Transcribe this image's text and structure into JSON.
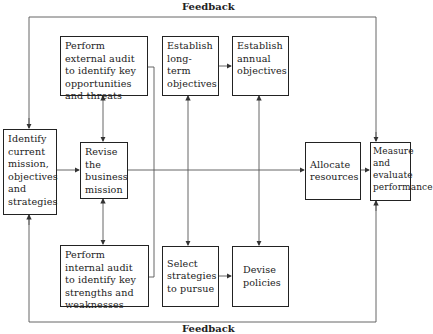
{
  "diagram": {
    "top_label": "Feedback",
    "bottom_label": "Feedback",
    "boxes": {
      "identify": "Identify current mission, objectives and strategies",
      "external_audit": "Perform external audit to identify key opportunities and threats",
      "revise": "Revise the business mission",
      "internal_audit": "Perform internal audit to identify key strengths and weaknesses",
      "long_term": "Establish long-term objectives",
      "annual": "Establish annual objectives",
      "select": "Select strategies to pursue",
      "devise": "Devise policies",
      "allocate": "Allocate resources",
      "measure": "Measure and evaluate performance"
    }
  }
}
